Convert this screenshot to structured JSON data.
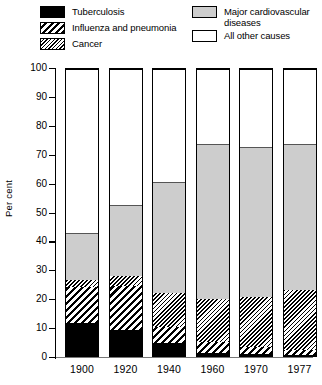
{
  "legend": {
    "left": [
      {
        "key": "tuberculosis",
        "label": "Tuberculosis",
        "swatch": "solid-black",
        "color": "#000000"
      },
      {
        "key": "influenza",
        "label": "Influenza and pneumonia",
        "swatch": "wide-diagonal-hatch",
        "color": "#000000"
      },
      {
        "key": "cancer",
        "label": "Cancer",
        "swatch": "fine-diagonal-hatch",
        "color": "#000000"
      }
    ],
    "right": [
      {
        "key": "cardiovascular",
        "label": "Major cardiovascular\ndiseases",
        "swatch": "gray-fill",
        "color": "#cdcdcd"
      },
      {
        "key": "other",
        "label": "All other causes",
        "swatch": "white-fill",
        "color": "#ffffff"
      }
    ]
  },
  "axis": {
    "y_title": "Per cent",
    "y_ticks": [
      "0",
      "10",
      "20",
      "30",
      "40",
      "50",
      "60",
      "70",
      "80",
      "90",
      "100"
    ],
    "x_ticks": [
      "1900",
      "1920",
      "1940",
      "1960",
      "1970",
      "1977"
    ]
  },
  "chart_data": {
    "type": "bar",
    "title": "",
    "subtitle": "",
    "xlabel": "",
    "ylabel": "Per cent",
    "ylim": [
      0,
      100
    ],
    "ytick_step": 10,
    "grid": false,
    "legend_position": "top",
    "stacked": true,
    "stack_order_bottom_to_top": [
      "Tuberculosis",
      "Influenza and pneumonia",
      "Cancer",
      "Major cardiovascular diseases",
      "All other causes"
    ],
    "categories": [
      "1900",
      "1920",
      "1940",
      "1960",
      "1970",
      "1977"
    ],
    "series": [
      {
        "name": "Tuberculosis",
        "pattern": "solid-black",
        "color": "#000000",
        "values": [
          11.5,
          9.0,
          4.5,
          1.0,
          0.6,
          0.5
        ]
      },
      {
        "name": "Influenza and pneumonia",
        "pattern": "wide-diagonal-hatch",
        "color": "#000000",
        "values": [
          12.5,
          15.5,
          5.5,
          4.0,
          2.4,
          1.5
        ]
      },
      {
        "name": "Cancer",
        "pattern": "fine-diagonal-hatch",
        "color": "#000000",
        "values": [
          2.5,
          3.5,
          12.0,
          15.0,
          17.5,
          21.0
        ]
      },
      {
        "name": "Major cardiovascular diseases",
        "pattern": "gray-fill",
        "color": "#cdcdcd",
        "values": [
          16.5,
          24.5,
          38.5,
          54.0,
          52.5,
          51.0
        ]
      },
      {
        "name": "All other causes",
        "pattern": "white-fill",
        "color": "#ffffff",
        "values": [
          57.0,
          47.5,
          39.5,
          26.0,
          27.0,
          26.0
        ]
      }
    ],
    "cumulative_tops": {
      "1900": [
        11.5,
        24.0,
        26.5,
        43.0,
        100
      ],
      "1920": [
        9.0,
        24.5,
        28.0,
        52.5,
        100
      ],
      "1940": [
        4.5,
        10.0,
        22.0,
        60.5,
        100
      ],
      "1960": [
        1.0,
        5.0,
        20.0,
        74.0,
        100
      ],
      "1970": [
        0.6,
        3.0,
        20.5,
        73.0,
        100
      ],
      "1977": [
        0.5,
        2.0,
        23.0,
        74.0,
        100
      ]
    }
  }
}
